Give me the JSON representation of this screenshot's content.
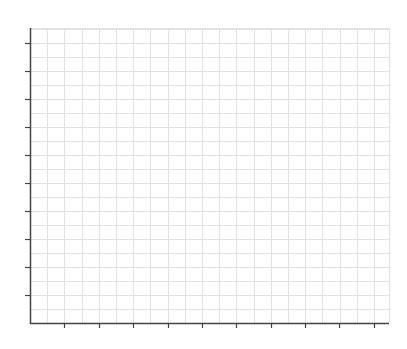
{
  "chart_data": {
    "type": "line",
    "title": "",
    "xlabel": "",
    "ylabel": "",
    "series": [],
    "grid": true,
    "legend": null,
    "x_ticks": {
      "count": 10,
      "labels": [
        "",
        "",
        "",
        "",
        "",
        "",
        "",
        "",
        "",
        ""
      ]
    },
    "y_ticks": {
      "count": 10,
      "labels": [
        "",
        "",
        "",
        "",
        "",
        "",
        "",
        "",
        "",
        ""
      ]
    },
    "note": "Empty plot area with grid; tick labels and axis titles are too faint to read"
  },
  "colors": {
    "axis": "#444444",
    "grid": "#e2e2e2",
    "background": "#ffffff"
  },
  "layout": {
    "plot_left": 30,
    "plot_right": 389,
    "plot_top": 28,
    "plot_bottom": 323,
    "x_tick_positions": [
      64,
      99,
      133,
      168,
      202,
      236,
      271,
      305,
      339,
      374
    ],
    "y_tick_positions": [
      43,
      71,
      99,
      127,
      155,
      183,
      211,
      239,
      267,
      295
    ],
    "v_grid_step": 17.2,
    "h_grid_step": 14
  }
}
